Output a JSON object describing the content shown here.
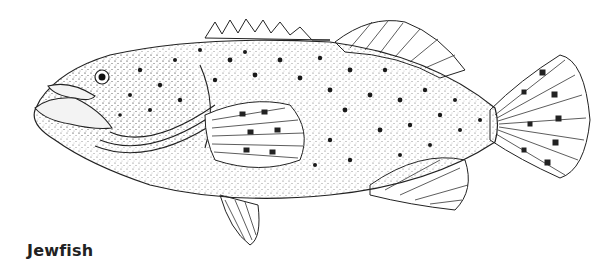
{
  "figure": {
    "caption": "Jewfish",
    "colors": {
      "ink": "#1a1a1a",
      "background": "#ffffff",
      "stipple": "#555555"
    }
  }
}
